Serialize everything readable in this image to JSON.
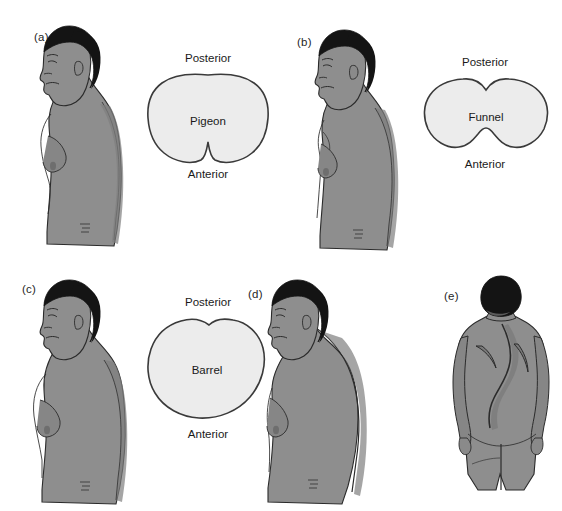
{
  "figure": {
    "background_color": "#ffffff",
    "skin_color": "#8e8e8e",
    "skin_shadow_color": "#7c7c7c",
    "skin_highlight_color": "#9b9b9b",
    "hair_color": "#141414",
    "outline_color": "#2b2b2b",
    "cross_section_fill": "#ececec",
    "cross_section_stroke": "#3a3a3a"
  },
  "panels": [
    {
      "id": "a",
      "letter": "(a)",
      "view": "lateral-profile",
      "cross_section": {
        "name": "Pigeon",
        "posterior_label": "Posterior",
        "anterior_label": "Anterior",
        "shape": "pigeon"
      }
    },
    {
      "id": "b",
      "letter": "(b)",
      "view": "lateral-profile",
      "cross_section": {
        "name": "Funnel",
        "posterior_label": "Posterior",
        "anterior_label": "Anterior",
        "shape": "funnel"
      }
    },
    {
      "id": "c",
      "letter": "(c)",
      "view": "lateral-profile",
      "cross_section": {
        "name": "Barrel",
        "posterior_label": "Posterior",
        "anterior_label": "Anterior",
        "shape": "barrel"
      }
    },
    {
      "id": "d",
      "letter": "(d)",
      "view": "lateral-profile",
      "cross_section": null
    },
    {
      "id": "e",
      "letter": "(e)",
      "view": "posterior-back",
      "cross_section": null
    }
  ]
}
